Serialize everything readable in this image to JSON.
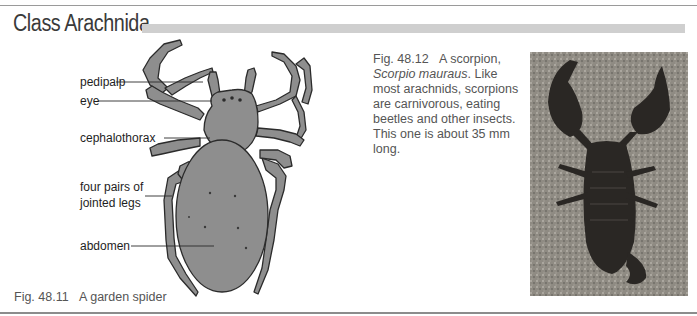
{
  "header": {
    "title": "Class Arachnida"
  },
  "figure_spider": {
    "caption_number": "Fig. 48.11",
    "caption_text": "A garden spider",
    "labels": [
      {
        "id": "pedipalp",
        "text": "pedipalp"
      },
      {
        "id": "eye",
        "text": "eye"
      },
      {
        "id": "cephalothorax",
        "text": "cephalothorax"
      },
      {
        "id": "legs_line1",
        "text": "four pairs of"
      },
      {
        "id": "legs_line2",
        "text": "jointed legs"
      },
      {
        "id": "abdomen",
        "text": "abdomen"
      }
    ],
    "colors": {
      "body": "#8e8e8e",
      "outline": "#2b2b2b"
    }
  },
  "figure_scorpion": {
    "caption_number": "Fig. 48.12",
    "caption_title": "A scorpion,",
    "species": "Scorpio mauraus",
    "caption_body": ". Like most arachnids, scorpions are carnivorous, eating beetles and other insects. This one is about 35 mm long."
  }
}
